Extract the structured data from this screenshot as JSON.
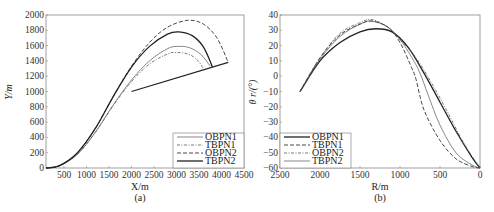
{
  "chart_data": [
    {
      "type": "line",
      "panel": "(a)",
      "title": "",
      "xlabel": "X/m",
      "ylabel": "Y/m",
      "xlim": [
        100,
        4500
      ],
      "ylim": [
        0,
        2000
      ],
      "xticks": [
        500,
        1000,
        1500,
        2000,
        2500,
        3000,
        3500,
        4000,
        4500
      ],
      "yticks": [
        0,
        200,
        400,
        600,
        800,
        1000,
        1200,
        1400,
        1600,
        1800,
        2000
      ],
      "grid": false,
      "legend_position": "lower right",
      "series": [
        {
          "name": "OBPN1",
          "style": "thin-solid",
          "x": [
            100,
            400,
            800,
            1200,
            1600,
            2000,
            2400,
            2800,
            3050,
            3300,
            3550,
            3750
          ],
          "y": [
            0,
            30,
            180,
            470,
            830,
            1150,
            1400,
            1560,
            1590,
            1570,
            1480,
            1330
          ]
        },
        {
          "name": "TBPN1",
          "style": "dash-dot",
          "x": [
            100,
            400,
            800,
            1200,
            1600,
            2000,
            2400,
            2800,
            3000,
            3250,
            3450,
            3600
          ],
          "y": [
            0,
            30,
            180,
            470,
            820,
            1130,
            1360,
            1490,
            1510,
            1490,
            1420,
            1300
          ]
        },
        {
          "name": "OBPN2",
          "style": "dashed",
          "x": [
            100,
            400,
            800,
            1200,
            1600,
            2000,
            2400,
            2800,
            3250,
            3600,
            3900,
            4150
          ],
          "y": [
            0,
            30,
            200,
            520,
            940,
            1330,
            1640,
            1840,
            1930,
            1880,
            1700,
            1380
          ]
        },
        {
          "name": "TBPN2",
          "style": "solid",
          "x": [
            100,
            400,
            800,
            1200,
            1600,
            2000,
            2400,
            2800,
            3050,
            3350,
            3600,
            3800
          ],
          "y": [
            0,
            30,
            200,
            520,
            940,
            1320,
            1590,
            1750,
            1780,
            1730,
            1580,
            1320
          ]
        },
        {
          "name": "target-line",
          "style": "solid",
          "x": [
            2000,
            4150
          ],
          "y": [
            1000,
            1380
          ]
        }
      ]
    },
    {
      "type": "line",
      "panel": "(b)",
      "title": "",
      "xlabel": "R/m",
      "ylabel": "θ_r/(°)",
      "xlim": [
        2500,
        0
      ],
      "ylim": [
        -60,
        40
      ],
      "xticks": [
        2500,
        2000,
        1500,
        1000,
        500,
        0
      ],
      "yticks": [
        -60,
        -50,
        -40,
        -30,
        -20,
        -10,
        0,
        10,
        20,
        30,
        40
      ],
      "grid": false,
      "legend_position": "lower left",
      "series": [
        {
          "name": "OBPN1",
          "style": "solid",
          "x": [
            2250,
            2000,
            1750,
            1500,
            1300,
            1100,
            900,
            700,
            500,
            300,
            100,
            0
          ],
          "y": [
            -10,
            10,
            22,
            29,
            31,
            29,
            19,
            2,
            -17,
            -36,
            -53,
            -60
          ]
        },
        {
          "name": "TBPN1",
          "style": "dashed",
          "x": [
            2250,
            2000,
            1750,
            1500,
            1350,
            1150,
            1000,
            850,
            800,
            700,
            500,
            300,
            100,
            0
          ],
          "y": [
            -10,
            12,
            27,
            34,
            36,
            32,
            22,
            5,
            -2,
            -22,
            -42,
            -54,
            -59,
            -60
          ]
        },
        {
          "name": "OBPN2",
          "style": "dash-dot",
          "x": [
            2250,
            2000,
            1750,
            1500,
            1350,
            1150,
            1000,
            800,
            600,
            400,
            200,
            0
          ],
          "y": [
            -10,
            12,
            28,
            35,
            37,
            32,
            24,
            12,
            -5,
            -24,
            -44,
            -60
          ]
        },
        {
          "name": "TBPN2",
          "style": "thin-solid",
          "x": [
            2250,
            2000,
            1750,
            1500,
            1350,
            1150,
            1000,
            850,
            750,
            650,
            500,
            300,
            100,
            0
          ],
          "y": [
            -10,
            11,
            26,
            34,
            36,
            32,
            24,
            12,
            2,
            -12,
            -32,
            -50,
            -58,
            -60
          ]
        }
      ]
    }
  ],
  "panels": {
    "a": {
      "caption": "(a)",
      "xlabel": "X/m",
      "ylabel": "Y/m",
      "xtick_labels": [
        "500",
        "1000",
        "1500",
        "2000",
        "2500",
        "3000",
        "3500",
        "4000",
        "4500"
      ],
      "ytick_labels": [
        "0",
        "200",
        "400",
        "600",
        "800",
        "1000",
        "1200",
        "1400",
        "1600",
        "1800",
        "2000"
      ],
      "legend": [
        "OBPN1",
        "TBPN1",
        "OBPN2",
        "TBPN2"
      ]
    },
    "b": {
      "caption": "(b)",
      "xlabel": "R/m",
      "ylabel": "θ r/(°)",
      "xtick_labels": [
        "2500",
        "2000",
        "1500",
        "1000",
        "500",
        "0"
      ],
      "ytick_labels": [
        "40",
        "30",
        "20",
        "10",
        "0",
        "−10",
        "−20",
        "−30",
        "−40",
        "−50",
        "−60"
      ],
      "legend": [
        "OBPN1",
        "TBPN1",
        "OBPN2",
        "TBPN2"
      ]
    }
  }
}
